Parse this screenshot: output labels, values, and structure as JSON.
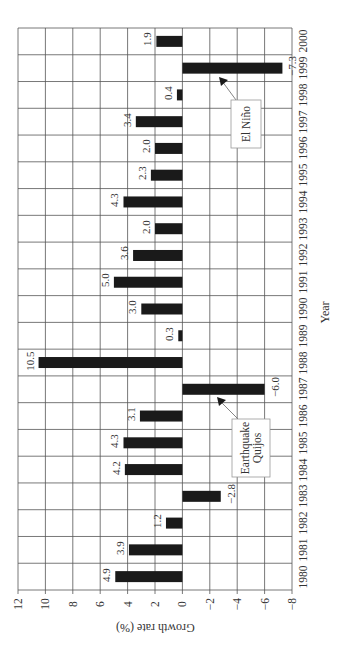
{
  "chart_data": {
    "type": "bar",
    "orientation": "rotated-90-ccw",
    "title": "",
    "xlabel": "Year",
    "ylabel": "Growth rate (%)",
    "ylim": [
      -8,
      12
    ],
    "yticks": [
      12,
      10,
      8,
      6,
      4,
      2,
      0,
      -2,
      -4,
      -6,
      -8
    ],
    "ytick_labels": [
      "12",
      "10",
      "8",
      "6",
      "4",
      "2",
      "0",
      "−2",
      "−4",
      "−6",
      "−8"
    ],
    "grid": true,
    "legend": null,
    "categories": [
      "1980",
      "1981",
      "1982",
      "1983",
      "1984",
      "1985",
      "1986",
      "1987",
      "1988",
      "1989",
      "1990",
      "1991",
      "1992",
      "1993",
      "1994",
      "1995",
      "1996",
      "1997",
      "1998",
      "1999",
      "2000"
    ],
    "values": [
      4.9,
      3.9,
      1.2,
      -2.8,
      4.2,
      4.3,
      3.1,
      -6.0,
      10.5,
      0.3,
      3.0,
      5.0,
      3.6,
      2.0,
      4.3,
      2.3,
      2.0,
      3.4,
      0.4,
      -7.3,
      1.9
    ],
    "value_labels": [
      "4.9",
      "3.9",
      "1.2",
      "−2.8",
      "4.2",
      "4.3",
      "3.1",
      "−6.0",
      "10.5",
      "0.3",
      "3.0",
      "5.0",
      "3.6",
      "2.0",
      "4.3",
      "2.3",
      "2.0",
      "3.4",
      "0.4",
      "−7.3",
      "1.9"
    ],
    "annotations": [
      {
        "text_lines": [
          "Earthquake",
          "Quijos"
        ],
        "points_to": "1987"
      },
      {
        "text_lines": [
          "El Niño"
        ],
        "points_to": "1999"
      }
    ],
    "colors": {
      "bar": "#1a1a1a",
      "grid": "#555555",
      "text": "#333333",
      "background": "#ffffff"
    }
  }
}
